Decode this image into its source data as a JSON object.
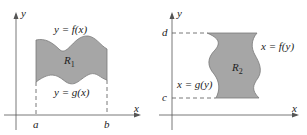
{
  "colors": {
    "region_fill": "#a6a6a6",
    "region_stroke": "#7a7a7a",
    "axis": "#555555",
    "text": "#222222"
  },
  "panel1": {
    "axis_x": "x",
    "axis_y": "y",
    "top_curve": "y = f(x)",
    "bottom_curve": "y = g(x)",
    "region": "R",
    "region_sub": "1",
    "tick_a": "a",
    "tick_b": "b"
  },
  "panel2": {
    "axis_x": "x",
    "axis_y": "y",
    "right_curve": "x = f(y)",
    "left_curve": "x = g(y)",
    "region": "R",
    "region_sub": "2",
    "tick_c": "c",
    "tick_d": "d"
  }
}
